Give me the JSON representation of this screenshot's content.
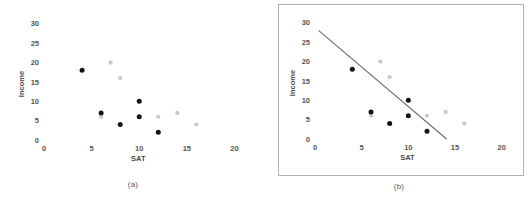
{
  "figure": {
    "panels": [
      {
        "id": "a",
        "caption": "(a)",
        "has_border": false,
        "has_trendline": false
      },
      {
        "id": "b",
        "caption": "(b)",
        "has_border": true,
        "has_trendline": true
      }
    ]
  },
  "chart_data": [
    {
      "type": "scatter",
      "title": "",
      "panel": "(a)",
      "xlabel": "SAT",
      "ylabel": "Income",
      "xlim": [
        0,
        21
      ],
      "ylim": [
        0,
        31
      ],
      "xticks": [
        0,
        5,
        10,
        15,
        20
      ],
      "yticks": [
        0,
        5,
        10,
        15,
        20,
        25,
        30
      ],
      "grid": false,
      "legend": "none",
      "series": [
        {
          "name": "dark-points",
          "color": "#141414",
          "points": [
            [
              4,
              18
            ],
            [
              6,
              7
            ],
            [
              8,
              4
            ],
            [
              10,
              10
            ],
            [
              10,
              6
            ],
            [
              12,
              2
            ]
          ]
        },
        {
          "name": "light-points",
          "color": "#c9c9c9",
          "points": [
            [
              6,
              6
            ],
            [
              7,
              20
            ],
            [
              8,
              16
            ],
            [
              12,
              6
            ],
            [
              14,
              7
            ],
            [
              16,
              4
            ]
          ]
        }
      ]
    },
    {
      "type": "scatter",
      "title": "",
      "panel": "(b)",
      "xlabel": "SAT",
      "ylabel": "Income",
      "xlim": [
        0,
        21
      ],
      "ylim": [
        0,
        31
      ],
      "xticks": [
        0,
        5,
        10,
        15,
        20
      ],
      "yticks": [
        0,
        5,
        10,
        15,
        20,
        25,
        30
      ],
      "grid": false,
      "legend": "none",
      "series": [
        {
          "name": "dark-points",
          "color": "#141414",
          "points": [
            [
              4,
              18
            ],
            [
              6,
              7
            ],
            [
              8,
              4
            ],
            [
              10,
              10
            ],
            [
              10,
              6
            ],
            [
              12,
              2
            ]
          ]
        },
        {
          "name": "light-points",
          "color": "#c9c9c9",
          "points": [
            [
              6,
              6
            ],
            [
              7,
              20
            ],
            [
              8,
              16
            ],
            [
              12,
              6
            ],
            [
              14,
              7
            ],
            [
              16,
              4
            ]
          ]
        }
      ],
      "trendline": {
        "name": "regression-line",
        "color": "#6b6b6b",
        "x0": 0.4,
        "y0": 28,
        "x1": 14.1,
        "y1": 0
      }
    }
  ]
}
